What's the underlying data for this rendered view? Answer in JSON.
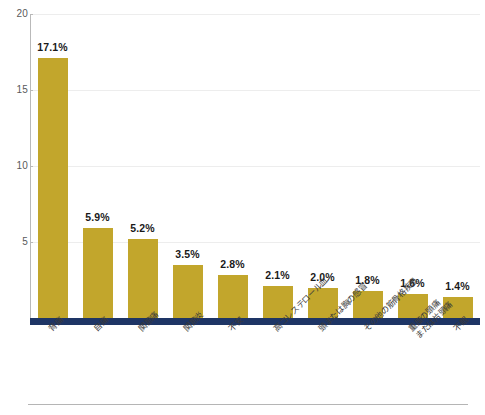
{
  "chart_data": {
    "type": "bar",
    "title": "",
    "subtitle": "",
    "xlabel": "",
    "ylabel": "",
    "ylim": [
      0,
      20
    ],
    "ytick_labels": [
      "20",
      "15",
      "10",
      "5"
    ],
    "yticks": [
      20,
      15,
      10,
      5
    ],
    "grid": true,
    "grid_axis": "y",
    "legend": false,
    "legend_position": "none",
    "categories": [
      "背痛",
      "自痛",
      "関節痛",
      "関節炎",
      "不安",
      "高コレステロール血",
      "頭または胸の感冒",
      "その他の筋骨格疾患",
      "重度の頭痛\nまたは片頭痛",
      "不眠"
    ],
    "category_lines": [
      [
        "背痛"
      ],
      [
        "自痛"
      ],
      [
        "関節痛"
      ],
      [
        "関節炎"
      ],
      [
        "不安"
      ],
      [
        "高コレステロール血"
      ],
      [
        "頭または胸の感冒"
      ],
      [
        "その他の筋骨格疾患"
      ],
      [
        "重度の頭痛",
        "または片頭痛"
      ],
      [
        "不眠"
      ]
    ],
    "values": [
      17.1,
      5.9,
      5.2,
      3.5,
      2.8,
      2.1,
      2.0,
      1.8,
      1.6,
      1.4
    ],
    "value_labels": [
      "17.1%",
      "5.9%",
      "5.2%",
      "3.5%",
      "2.8%",
      "2.1%",
      "2.0%",
      "1.8%",
      "1.6%",
      "1.4%"
    ],
    "colors": {
      "bar": "#c2a62c",
      "baseline": "#1e3565",
      "grid": "#ededed",
      "axis": "#b9b9b9",
      "tick_text": "#59595b",
      "value_text": "#1a1a1a",
      "category_text": "#3a3a3a",
      "background": "#ffffff",
      "bottom_rule": "#b5b5b5"
    }
  }
}
